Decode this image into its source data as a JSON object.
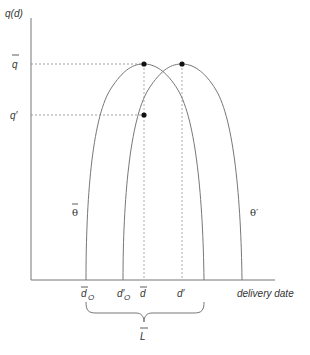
{
  "diagram": {
    "y_axis_label": "q(d)",
    "x_axis_label": "delivery date",
    "y_ticks": [
      {
        "label": "q",
        "bar": true,
        "prime": false,
        "y": 64
      },
      {
        "label": "q′",
        "bar": false,
        "prime": true,
        "y": 115
      }
    ],
    "x_ticks": [
      {
        "label": "d",
        "sub": "O",
        "bar": true,
        "x": 86
      },
      {
        "label": "d′",
        "sub": "O",
        "bar": false,
        "x": 123
      },
      {
        "label": "d",
        "sub": "",
        "bar": true,
        "x": 144
      },
      {
        "label": "d′",
        "sub": "",
        "bar": false,
        "x": 182
      }
    ],
    "curves": [
      {
        "name": "theta-bar",
        "label": "θ",
        "bar": true,
        "left_foot_x": 86,
        "peak_x": 144,
        "right_foot_x": 204
      },
      {
        "name": "theta-prime",
        "label": "θ′",
        "bar": false,
        "left_foot_x": 123,
        "peak_x": 182,
        "right_foot_x": 242
      }
    ],
    "points": [
      {
        "name": "peak-theta-bar",
        "x": 144,
        "y": 64
      },
      {
        "name": "peak-theta-prime",
        "x": 182,
        "y": 64
      },
      {
        "name": "q-prime-point",
        "x": 144,
        "y": 115
      }
    ],
    "brace": {
      "label": "L",
      "bar": true,
      "from_x": 86,
      "to_x": 204
    },
    "colors": {
      "line": "#777777",
      "dash": "#888888",
      "dot": "#111111",
      "text": "#333333"
    }
  }
}
